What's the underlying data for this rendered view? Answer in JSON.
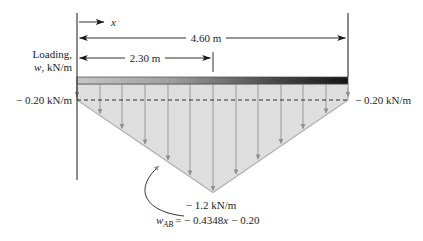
{
  "labels": {
    "x_axis": "x",
    "dim_total": "4.60 m",
    "dim_half": "2.30 m",
    "loading_line1": "Loading,",
    "loading_w": "w",
    "loading_rest": ", kN/m",
    "left_intensity": "− 0.20 kN/m",
    "right_intensity": "− 0.20 kN/m",
    "peak_intensity": "− 1.2 kN/m",
    "eq_w": "w",
    "eq_sub": "AB",
    "eq_mid": "= − 0.4348",
    "eq_x": "x",
    "eq_end": "− 0.20"
  },
  "diagram": {
    "type": "distributed-load-diagram",
    "total_length_m": 4.6,
    "half_length_m": 2.3,
    "end_intensity_kN_per_m": -0.2,
    "peak_intensity_kN_per_m": -1.2,
    "load_equation": "wAB = -0.4348x - 0.20"
  },
  "colors": {
    "load_fill": "#dedede",
    "load_edge": "#b0b0b0",
    "bar_left": "#c6c6c6",
    "bar_mid": "#9e9e9e",
    "bar_dark": "#4a4a4a",
    "bar_right": "#141414",
    "line_black": "#1a1a1a",
    "grid_gray": "#9b9b9b"
  }
}
